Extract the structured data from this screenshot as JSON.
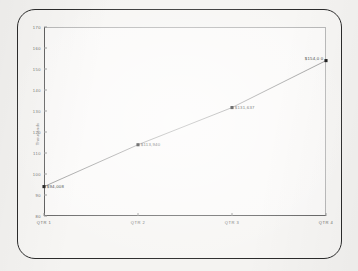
{
  "chart_data": {
    "type": "line",
    "title": "",
    "subtitle": "",
    "xlabel": "",
    "ylabel": "Thousands",
    "categories": [
      "QTR 1",
      "QTR 2",
      "QTR 3",
      "QTR 4"
    ],
    "values": [
      94.008,
      113.94,
      131.637,
      154.0
    ],
    "point_labels": [
      "$94,008",
      "$113,940",
      "$131,637",
      "$154,0 0"
    ],
    "ylim": [
      80,
      170
    ],
    "y_ticks": [
      80,
      90,
      100,
      110,
      120,
      130,
      140,
      150,
      160,
      170
    ],
    "y_tick_labels": [
      "80",
      "90",
      "100",
      "110",
      "120",
      "130",
      "140",
      "150",
      "160",
      "170"
    ],
    "grid": false,
    "legend": "none",
    "marker": "square",
    "marker_color": "#1a1a1a",
    "line_color": "#8a8a8a",
    "series": [
      {
        "name": "Series 1",
        "values": [
          94.008,
          113.94,
          131.637,
          154.0
        ]
      }
    ]
  },
  "page": {
    "background_color": "#f3f2f0",
    "frame_color": "#2c2c2c"
  }
}
